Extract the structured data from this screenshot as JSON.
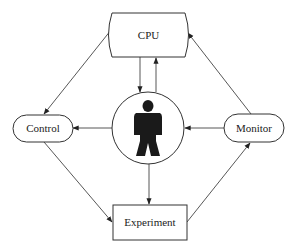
{
  "diagram": {
    "background": "#ffffff",
    "stroke_color": "#333333",
    "figure_color": "#1a1a1a",
    "nodes": {
      "cpu": {
        "label": "CPU",
        "shape": "barrel-rectangle"
      },
      "control": {
        "label": "Control",
        "shape": "rounded-pill"
      },
      "monitor": {
        "label": "Monitor",
        "shape": "rounded-pill"
      },
      "experiment": {
        "label": "Experiment",
        "shape": "rectangle"
      },
      "human": {
        "label": "",
        "shape": "circle-with-human-silhouette"
      }
    },
    "edges": [
      {
        "from": "CPU",
        "to": "Control"
      },
      {
        "from": "CPU",
        "to": "Human"
      },
      {
        "from": "Human",
        "to": "CPU"
      },
      {
        "from": "Human",
        "to": "Control"
      },
      {
        "from": "Monitor",
        "to": "Human"
      },
      {
        "from": "Monitor",
        "to": "CPU"
      },
      {
        "from": "Control",
        "to": "Experiment"
      },
      {
        "from": "Experiment",
        "to": "Monitor"
      },
      {
        "from": "Human",
        "to": "Experiment"
      }
    ]
  }
}
